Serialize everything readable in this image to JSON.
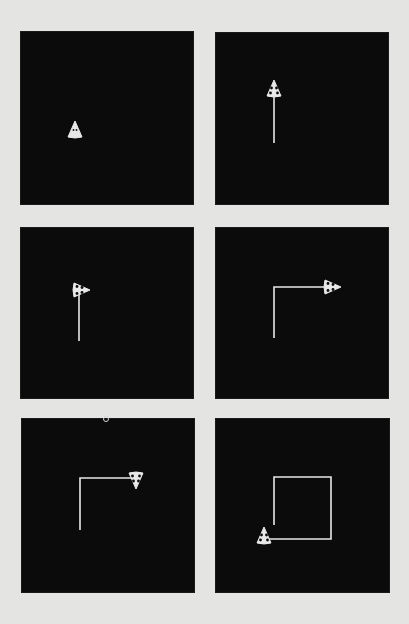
{
  "figure": {
    "background_color": "#e4e4e2",
    "panel_color": "#0b0b0b",
    "ink_color": "#e8e8e8",
    "panels": [
      {
        "id": 1,
        "box": {
          "x": 21,
          "y": 32,
          "w": 172,
          "h": 172
        },
        "path": [],
        "turtle": {
          "x": 54,
          "y": 98,
          "heading": "up",
          "filled": true
        }
      },
      {
        "id": 2,
        "box": {
          "x": 216,
          "y": 33,
          "w": 172,
          "h": 171
        },
        "path": [
          [
            58,
            110
          ],
          [
            58,
            58
          ]
        ],
        "turtle": {
          "x": 58,
          "y": 56,
          "heading": "up",
          "filled": false
        }
      },
      {
        "id": 3,
        "box": {
          "x": 21,
          "y": 228,
          "w": 172,
          "h": 170
        },
        "path": [
          [
            58,
            113
          ],
          [
            58,
            62
          ]
        ],
        "turtle": {
          "x": 60,
          "y": 62,
          "heading": "right",
          "filled": false
        }
      },
      {
        "id": 4,
        "box": {
          "x": 216,
          "y": 228,
          "w": 172,
          "h": 170
        },
        "path": [
          [
            58,
            110
          ],
          [
            58,
            59
          ],
          [
            116,
            59
          ]
        ],
        "turtle": {
          "x": 116,
          "y": 59,
          "heading": "right",
          "filled": false
        }
      },
      {
        "id": 5,
        "box": {
          "x": 22,
          "y": 419,
          "w": 172,
          "h": 173
        },
        "path": [
          [
            58,
            111
          ],
          [
            58,
            59
          ],
          [
            114,
            59
          ]
        ],
        "turtle": {
          "x": 114,
          "y": 61,
          "heading": "down",
          "filled": false
        }
      },
      {
        "id": 6,
        "box": {
          "x": 216,
          "y": 419,
          "w": 173,
          "h": 173
        },
        "path": [
          [
            58,
            106
          ],
          [
            58,
            58
          ],
          [
            115,
            58
          ],
          [
            115,
            120
          ],
          [
            49,
            120
          ]
        ],
        "turtle": {
          "x": 48,
          "y": 117,
          "heading": "up",
          "filled": false
        }
      }
    ],
    "artifact": {
      "x": 106,
      "y": 419
    }
  }
}
